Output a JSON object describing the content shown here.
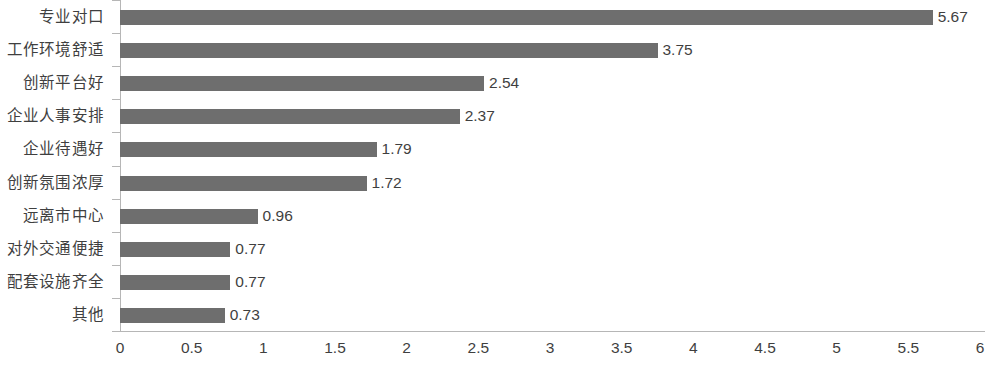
{
  "chart_data": {
    "type": "bar",
    "orientation": "horizontal",
    "title": "",
    "subtitle": "",
    "xlabel": "",
    "ylabel": "",
    "xlim": [
      0,
      6
    ],
    "ylim": null,
    "grid": false,
    "legend": null,
    "legend_position": "none",
    "bar_color": "#6e6e6e",
    "axis_color": "#b6b6b6",
    "text_color": "#3f3f3f",
    "x_ticks": [
      "0",
      "0.5",
      "1",
      "1.5",
      "2",
      "2.5",
      "3",
      "3.5",
      "4",
      "4.5",
      "5",
      "5.5",
      "6"
    ],
    "x_tick_values": [
      0,
      0.5,
      1,
      1.5,
      2,
      2.5,
      3,
      3.5,
      4,
      4.5,
      5,
      5.5,
      6
    ],
    "categories": [
      "专业对口",
      "工作环境舒适",
      "创新平台好",
      "企业人事安排",
      "企业待遇好",
      "创新氛围浓厚",
      "远离市中心",
      "对外交通便捷",
      "配套设施齐全",
      "其他"
    ],
    "values": [
      5.67,
      3.75,
      2.54,
      2.37,
      1.79,
      1.72,
      0.96,
      0.77,
      0.77,
      0.73
    ],
    "value_labels": [
      "5.67",
      "3.75",
      "2.54",
      "2.37",
      "1.79",
      "1.72",
      "0.96",
      "0.77",
      "0.77",
      "0.73"
    ]
  }
}
